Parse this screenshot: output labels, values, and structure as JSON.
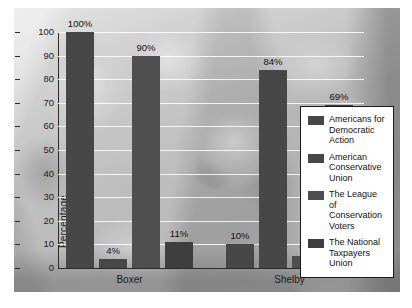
{
  "chart_data": {
    "type": "bar",
    "title": "",
    "subtitle": "",
    "xlabel": "",
    "ylabel": "Percentage",
    "ylim": [
      0,
      100
    ],
    "ytick_step": 10,
    "yticks": [
      0,
      10,
      20,
      30,
      40,
      50,
      60,
      70,
      80,
      90,
      100
    ],
    "grid": true,
    "legend_position": "right-inside",
    "categories": [
      "Boxer",
      "Shelby"
    ],
    "series": [
      {
        "name": "Americans for Democratic Action",
        "values": [
          100,
          10
        ],
        "labels": [
          "100%",
          "10%"
        ],
        "color": "#474747"
      },
      {
        "name": "American Conservative Union",
        "values": [
          4,
          84
        ],
        "labels": [
          "4%",
          "84%"
        ],
        "color": "#474747"
      },
      {
        "name": "The League of Conservation Voters",
        "values": [
          90,
          5
        ],
        "labels": [
          "90%",
          "5%"
        ],
        "color": "#4f4f4f"
      },
      {
        "name": "The National Taxpayers Union",
        "values": [
          11,
          69
        ],
        "labels": [
          "11%",
          "69%"
        ],
        "color": "#3e3e3e"
      }
    ],
    "bars": [
      {
        "group": "Boxer",
        "series": "Americans for Democratic Action",
        "value": 100,
        "label": "100%"
      },
      {
        "group": "Boxer",
        "series": "American Conservative Union",
        "value": 4,
        "label": "4%"
      },
      {
        "group": "Boxer",
        "series": "The League of Conservation Voters",
        "value": 90,
        "label": "90%"
      },
      {
        "group": "Boxer",
        "series": "The National Taxpayers Union",
        "value": 11,
        "label": "11%"
      },
      {
        "group": "Shelby",
        "series": "Americans for Democratic Action",
        "value": 10,
        "label": "10%"
      },
      {
        "group": "Shelby",
        "series": "American Conservative Union",
        "value": 84,
        "label": "84%"
      },
      {
        "group": "Shelby",
        "series": "The League of Conservation Voters",
        "value": 5,
        "label": "5%"
      },
      {
        "group": "Shelby",
        "series": "The National Taxpayers Union",
        "value": 69,
        "label": "69%"
      }
    ]
  },
  "axis": {
    "y_label": "Percentage",
    "y_ticks": [
      "100",
      "90",
      "80",
      "70",
      "60",
      "50",
      "40",
      "30",
      "20",
      "10",
      "0"
    ],
    "x_labels": [
      "Boxer",
      "Shelby"
    ]
  },
  "legend": {
    "items": [
      {
        "label": "Americans for Democratic Action",
        "color": "#474747"
      },
      {
        "label": "American Conservative Union",
        "color": "#474747"
      },
      {
        "label": "The League of Conservation Voters",
        "color": "#4f4f4f"
      },
      {
        "label": "The National Taxpayers Union",
        "color": "#3e3e3e"
      }
    ]
  },
  "background": {
    "kind": "photograph",
    "description": "faded grayscale crowd photograph"
  },
  "data_labels": [
    "100%",
    "4%",
    "90%",
    "11%",
    "10%",
    "84%",
    "5%",
    "69%"
  ]
}
